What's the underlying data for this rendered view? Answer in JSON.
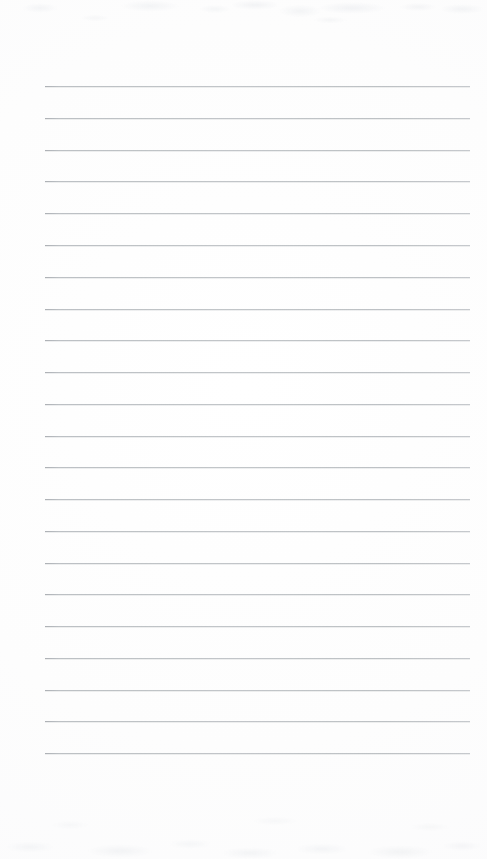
{
  "document": {
    "type": "scanned-lined-paper",
    "title": "Blank Lined Notepaper",
    "description": "Scanned blank sheet of ruled writing paper with no handwriting or printed text",
    "width_px": 487,
    "height_px": 859,
    "paper_color": "#fdfdfd",
    "background_color": "#ffffff",
    "has_text_content": false,
    "has_margin_rule": false,
    "has_punch_holes": false,
    "has_header": false,
    "has_page_number": false
  },
  "ruling": {
    "line_count": 22,
    "line_color": "#b9bdc1",
    "line_thickness_px": 1,
    "line_left_x": 45,
    "line_right_x": 470,
    "line_width_px": 425,
    "first_line_y": 86,
    "last_line_y": 753,
    "line_spacing_px": 31.8,
    "margin_left_px": 45,
    "margin_right_px": 17,
    "margin_top_px": 86,
    "margin_bottom_px": 106,
    "lines": [
      {
        "index": 1,
        "y": 86
      },
      {
        "index": 2,
        "y": 118
      },
      {
        "index": 3,
        "y": 150
      },
      {
        "index": 4,
        "y": 181
      },
      {
        "index": 5,
        "y": 213
      },
      {
        "index": 6,
        "y": 245
      },
      {
        "index": 7,
        "y": 277
      },
      {
        "index": 8,
        "y": 309
      },
      {
        "index": 9,
        "y": 340
      },
      {
        "index": 10,
        "y": 372
      },
      {
        "index": 11,
        "y": 404
      },
      {
        "index": 12,
        "y": 436
      },
      {
        "index": 13,
        "y": 467
      },
      {
        "index": 14,
        "y": 499
      },
      {
        "index": 15,
        "y": 531
      },
      {
        "index": 16,
        "y": 563
      },
      {
        "index": 17,
        "y": 594
      },
      {
        "index": 18,
        "y": 626
      },
      {
        "index": 19,
        "y": 658
      },
      {
        "index": 20,
        "y": 690
      },
      {
        "index": 21,
        "y": 721
      },
      {
        "index": 22,
        "y": 753
      }
    ]
  },
  "artifacts": {
    "top_edge_noise": true,
    "bottom_edge_noise": true,
    "noise_color": "#eaecef",
    "note": "faint mottled greyish scanner noise bands along top and bottom edges"
  }
}
